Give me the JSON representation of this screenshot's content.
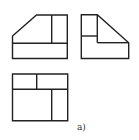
{
  "diagram": {
    "type": "orthographic-projection",
    "stroke_color": "#222222",
    "background": "#ffffff",
    "caption": "a)",
    "views": {
      "front": {
        "name": "front-view",
        "outline": [
          [
            12.5,
            36
          ],
          [
            36.5,
            15
          ],
          [
            67.3,
            15
          ],
          [
            67.3,
            58.5
          ],
          [
            12.5,
            58.5
          ]
        ],
        "lines": [
          [
            [
              12.5,
              43.3
            ],
            [
              67.3,
              43.3
            ]
          ],
          [
            [
              51.7,
              15
            ],
            [
              51.7,
              43.3
            ]
          ]
        ]
      },
      "side": {
        "name": "side-view",
        "outline": [
          [
            81.3,
            14.7
          ],
          [
            97.3,
            14.7
          ],
          [
            128.7,
            42.7
          ],
          [
            128.7,
            58.5
          ],
          [
            81.3,
            58.5
          ]
        ],
        "lines": [
          [
            [
              81.3,
              36
            ],
            [
              97.3,
              36
            ]
          ],
          [
            [
              97.3,
              14.7
            ],
            [
              97.3,
              42.7
            ]
          ],
          [
            [
              97.3,
              42.7
            ],
            [
              128.7,
              42.7
            ]
          ]
        ]
      },
      "top": {
        "name": "top-view",
        "outline": [
          [
            12.5,
            74
          ],
          [
            67.7,
            74
          ],
          [
            67.7,
            120.7
          ],
          [
            12.5,
            120.7
          ]
        ],
        "lines": [
          [
            [
              12.5,
              89.3
            ],
            [
              67.7,
              89.3
            ]
          ],
          [
            [
              36.7,
              74
            ],
            [
              36.7,
              89.3
            ]
          ],
          [
            [
              51.7,
              89.3
            ],
            [
              51.7,
              120.7
            ]
          ]
        ]
      }
    }
  }
}
